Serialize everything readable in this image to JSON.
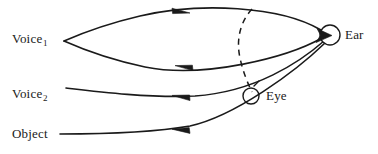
{
  "diagram": {
    "stroke_color": "#1a1a1a",
    "background_color": "#ffffff",
    "labels": {
      "voice1": "Voice",
      "voice1_sub": "1",
      "voice2": "Voice",
      "voice2_sub": "2",
      "object": "Object",
      "ear": "Ear",
      "eye": "Eye"
    },
    "nodes": [
      {
        "name": "ear",
        "label": "Ear",
        "shape": "circle",
        "cx": 330,
        "cy": 35,
        "r": 10
      },
      {
        "name": "eye",
        "label": "Eye",
        "shape": "circle",
        "cx": 251,
        "cy": 96,
        "r": 8
      }
    ],
    "edges": [
      {
        "name": "voice1-upper-return",
        "from": "ear",
        "to": "voice1",
        "style": "solid",
        "arrow_direction": "left",
        "arrow_at": {
          "x": 181,
          "y": 10
        }
      },
      {
        "name": "voice1-lower-outgoing",
        "from": "voice1",
        "to": "ear",
        "style": "solid",
        "arrow_direction": "right",
        "arrow_at": {
          "x": 184,
          "y": 68
        }
      },
      {
        "name": "voice2-outgoing",
        "from": "voice2",
        "to": "ear",
        "style": "solid",
        "arrow_direction": "right",
        "arrow_at": {
          "x": 181,
          "y": 98
        }
      },
      {
        "name": "object-outgoing",
        "from": "object",
        "to": "ear",
        "style": "solid",
        "arrow_direction": "right",
        "arrow_at": {
          "x": 181,
          "y": 131
        }
      },
      {
        "name": "ear-eye-dashed-arc",
        "from": "ear",
        "to": "eye",
        "style": "dashed",
        "arrow_direction": "none"
      }
    ]
  }
}
